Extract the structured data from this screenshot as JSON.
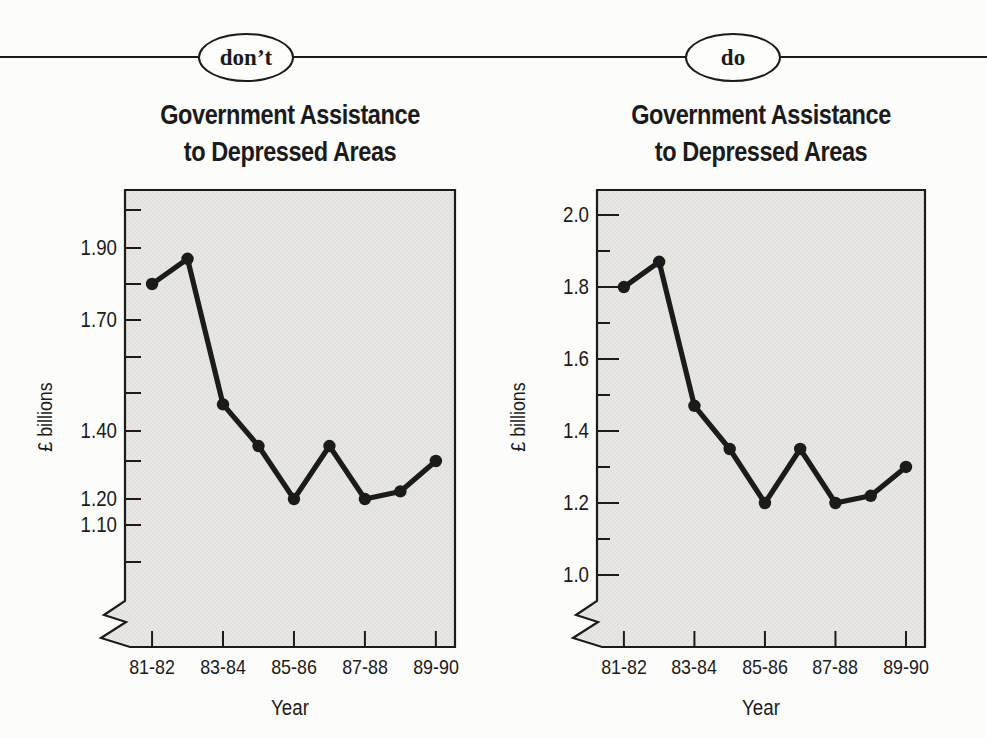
{
  "page": {
    "background": "#fcfcfa",
    "ink": "#1b1b1b",
    "plot_fill": "#e8e7e4",
    "plot_fill_dot": "#dbdad6",
    "badge_fill": "#fdfdfc"
  },
  "banner": {
    "dont_label": "don’t",
    "do_label": "do"
  },
  "chart_data": [
    {
      "type": "line",
      "variant": "dont",
      "title": "Government Assistance to Depressed Areas",
      "title_lines": [
        "Government Assistance",
        "to Depressed Areas"
      ],
      "xlabel": "Year",
      "ylabel": "£ billions",
      "x_categories": [
        "81-82",
        "82-83",
        "83-84",
        "84-85",
        "85-86",
        "86-87",
        "87-88",
        "88-89",
        "89-90"
      ],
      "x_tick_labels": [
        "81-82",
        "83-84",
        "85-86",
        "87-88",
        "89-90"
      ],
      "values": [
        1.8,
        1.87,
        1.47,
        1.35,
        1.2,
        1.35,
        1.2,
        1.22,
        1.3
      ],
      "ylim": [
        1.0,
        2.0
      ],
      "axis_break": true,
      "grid": false,
      "legend": null,
      "tick_style": "uniform-length, irregularly labelled",
      "y_ticks": [
        {
          "value": 2.0,
          "label": "",
          "pos": 0.0438
        },
        {
          "value": 1.9,
          "label": "1.90",
          "pos": 0.1269
        },
        {
          "value": 1.8,
          "label": "",
          "pos": 0.2057
        },
        {
          "value": 1.7,
          "label": "1.70",
          "pos": 0.2845
        },
        {
          "value": 1.6,
          "label": "",
          "pos": 0.3654
        },
        {
          "value": 1.5,
          "label": "",
          "pos": 0.4442
        },
        {
          "value": 1.4,
          "label": "1.40",
          "pos": 0.5274
        },
        {
          "value": 1.3,
          "label": "",
          "pos": 0.593
        },
        {
          "value": 1.2,
          "label": "1.20",
          "pos": 0.6762
        },
        {
          "value": 1.1,
          "label": "1.10",
          "pos": 0.733
        },
        {
          "value": 1.0,
          "label": "",
          "pos": 0.814
        }
      ]
    },
    {
      "type": "line",
      "variant": "do",
      "title": "Government Assistance to Depressed Areas",
      "title_lines": [
        "Government Assistance",
        "to Depressed Areas"
      ],
      "xlabel": "Year",
      "ylabel": "£ billions",
      "x_categories": [
        "81-82",
        "82-83",
        "83-84",
        "84-85",
        "85-86",
        "86-87",
        "87-88",
        "88-89",
        "89-90"
      ],
      "x_tick_labels": [
        "81-82",
        "83-84",
        "85-86",
        "87-88",
        "89-90"
      ],
      "values": [
        1.8,
        1.87,
        1.47,
        1.35,
        1.2,
        1.35,
        1.2,
        1.22,
        1.3
      ],
      "ylim": [
        1.0,
        2.0
      ],
      "axis_break": true,
      "grid": false,
      "legend": null,
      "tick_style": "major-minor, regularly labelled every 0.2",
      "y_ticks": [
        {
          "value": 2.0,
          "label": "2.0",
          "pos": 0.0547
        },
        {
          "value": 1.9,
          "label": "",
          "pos": 0.1335
        },
        {
          "value": 1.8,
          "label": "1.8",
          "pos": 0.2123
        },
        {
          "value": 1.7,
          "label": "",
          "pos": 0.291
        },
        {
          "value": 1.6,
          "label": "1.6",
          "pos": 0.3698
        },
        {
          "value": 1.5,
          "label": "",
          "pos": 0.4486
        },
        {
          "value": 1.4,
          "label": "1.4",
          "pos": 0.5274
        },
        {
          "value": 1.3,
          "label": "",
          "pos": 0.6061
        },
        {
          "value": 1.2,
          "label": "1.2",
          "pos": 0.6849
        },
        {
          "value": 1.1,
          "label": "",
          "pos": 0.7637
        },
        {
          "value": 1.0,
          "label": "1.0",
          "pos": 0.8425
        }
      ]
    }
  ]
}
